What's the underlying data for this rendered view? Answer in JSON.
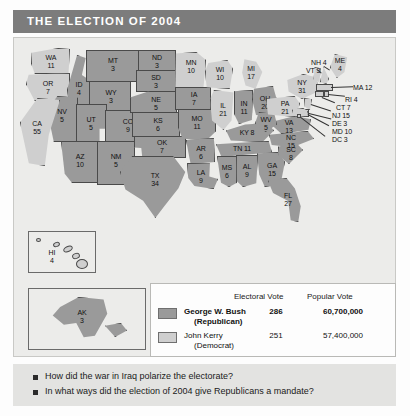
{
  "title": "THE ELECTION OF 2004",
  "map": {
    "states": [
      {
        "code": "WA",
        "votes": "11",
        "party": "kerry"
      },
      {
        "code": "OR",
        "votes": "7",
        "party": "kerry"
      },
      {
        "code": "CA",
        "votes": "55",
        "party": "kerry"
      },
      {
        "code": "NV",
        "votes": "5",
        "party": "bush"
      },
      {
        "code": "ID",
        "votes": "4",
        "party": "bush"
      },
      {
        "code": "MT",
        "votes": "3",
        "party": "bush"
      },
      {
        "code": "WY",
        "votes": "3",
        "party": "bush"
      },
      {
        "code": "UT",
        "votes": "5",
        "party": "bush"
      },
      {
        "code": "AZ",
        "votes": "10",
        "party": "bush"
      },
      {
        "code": "NM",
        "votes": "5",
        "party": "bush"
      },
      {
        "code": "CO",
        "votes": "9",
        "party": "bush"
      },
      {
        "code": "ND",
        "votes": "3",
        "party": "bush"
      },
      {
        "code": "SD",
        "votes": "3",
        "party": "bush"
      },
      {
        "code": "NE",
        "votes": "5",
        "party": "bush"
      },
      {
        "code": "KS",
        "votes": "6",
        "party": "bush"
      },
      {
        "code": "OK",
        "votes": "7",
        "party": "bush"
      },
      {
        "code": "TX",
        "votes": "34",
        "party": "bush"
      },
      {
        "code": "MN",
        "votes": "10",
        "party": "kerry"
      },
      {
        "code": "IA",
        "votes": "7",
        "party": "bush"
      },
      {
        "code": "MO",
        "votes": "11",
        "party": "bush"
      },
      {
        "code": "AR",
        "votes": "6",
        "party": "bush"
      },
      {
        "code": "LA",
        "votes": "9",
        "party": "bush"
      },
      {
        "code": "WI",
        "votes": "10",
        "party": "kerry"
      },
      {
        "code": "IL",
        "votes": "21",
        "party": "kerry"
      },
      {
        "code": "MI",
        "votes": "17",
        "party": "kerry"
      },
      {
        "code": "IN",
        "votes": "11",
        "party": "bush"
      },
      {
        "code": "OH",
        "votes": "20",
        "party": "bush"
      },
      {
        "code": "KY",
        "votes": "8",
        "party": "bush"
      },
      {
        "code": "TN",
        "votes": "11",
        "party": "bush"
      },
      {
        "code": "MS",
        "votes": "6",
        "party": "bush"
      },
      {
        "code": "AL",
        "votes": "9",
        "party": "bush"
      },
      {
        "code": "GA",
        "votes": "15",
        "party": "bush"
      },
      {
        "code": "FL",
        "votes": "27",
        "party": "bush"
      },
      {
        "code": "SC",
        "votes": "8",
        "party": "bush"
      },
      {
        "code": "NC",
        "votes": "15",
        "party": "bush"
      },
      {
        "code": "VA",
        "votes": "13",
        "party": "bush"
      },
      {
        "code": "WV",
        "votes": "5",
        "party": "bush"
      },
      {
        "code": "PA",
        "votes": "21",
        "party": "kerry"
      },
      {
        "code": "NY",
        "votes": "31",
        "party": "kerry"
      },
      {
        "code": "ME",
        "votes": "4",
        "party": "kerry"
      },
      {
        "code": "NH",
        "votes": "4",
        "party": "kerry"
      },
      {
        "code": "VT",
        "votes": "3",
        "party": "kerry"
      },
      {
        "code": "MA",
        "votes": "12",
        "party": "kerry"
      },
      {
        "code": "RI",
        "votes": "4",
        "party": "kerry"
      },
      {
        "code": "CT",
        "votes": "7",
        "party": "kerry"
      },
      {
        "code": "NJ",
        "votes": "15",
        "party": "kerry"
      },
      {
        "code": "DE",
        "votes": "3",
        "party": "kerry"
      },
      {
        "code": "MD",
        "votes": "10",
        "party": "kerry"
      },
      {
        "code": "DC",
        "votes": "3",
        "party": "kerry"
      },
      {
        "code": "HI",
        "votes": "4",
        "party": "kerry"
      },
      {
        "code": "AK",
        "votes": "3",
        "party": "bush"
      }
    ],
    "labels": {
      "WA": "WA\n11",
      "OR": "OR\n7",
      "CA": "CA\n55",
      "NV": "NV\n5",
      "ID": "ID\n4",
      "MT": "MT\n3",
      "WY": "WY\n3",
      "UT": "UT\n5",
      "AZ": "AZ\n10",
      "NM": "NM\n5",
      "CO": "CO\n9",
      "ND": "ND\n3",
      "SD": "SD\n3",
      "NE": "NE\n5",
      "KS": "KS\n6",
      "OK": "OK\n7",
      "TX": "TX\n34",
      "MN": "MN\n10",
      "IA": "IA\n7",
      "MO": "MO\n11",
      "AR": "AR\n6",
      "LA": "LA\n9",
      "WI": "WI\n10",
      "IL": "IL\n21",
      "MI": "MI\n17",
      "IN": "IN\n11",
      "OH": "OH\n20",
      "KY": "KY 8",
      "TN": "TN 11",
      "MS": "MS\n6",
      "AL": "AL\n9",
      "GA": "GA\n15",
      "FL": "FL\n27",
      "SC": "SC\n8",
      "NC": "NC\n15",
      "VA": "VA\n13",
      "WV": "WV\n5",
      "PA": "PA\n21",
      "NY": "NY\n31",
      "ME": "ME\n4",
      "NH": "NH 4",
      "VT": "VT 3",
      "MA": "MA 12",
      "RI": "RI 4",
      "CT": "CT 7",
      "NJ": "NJ 15",
      "DE": "DE 3",
      "MD": "MD 10",
      "DC": "DC 3",
      "HI": "HI\n4",
      "AK": "AK\n3"
    }
  },
  "legend": {
    "columns": {
      "electoral": "Electoral Vote",
      "popular": "Popular Vote"
    },
    "rows": [
      {
        "name": "George W. Bush",
        "party": "(Republican)",
        "electoral": "286",
        "popular": "60,700,000",
        "color": "#9a9a9a"
      },
      {
        "name": "John Kerry",
        "party": "(Democrat)",
        "electoral": "251",
        "popular": "57,400,000",
        "color": "#cfcfcf"
      }
    ]
  },
  "questions": [
    "How did the war in Iraq polarize the electorate?",
    "In what ways did the election of 2004 give Republicans a mandate?"
  ]
}
